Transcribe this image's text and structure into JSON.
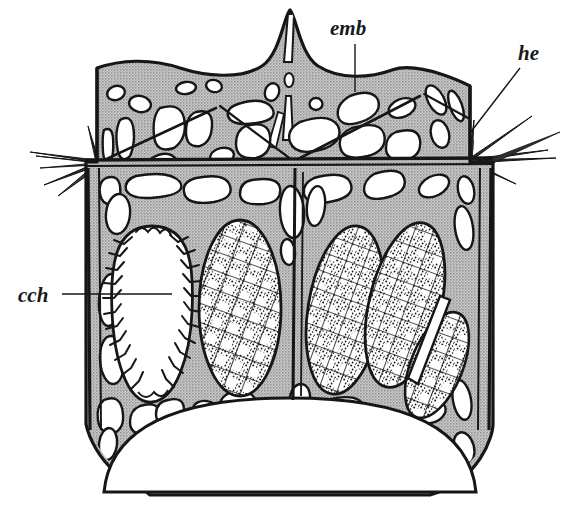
{
  "figure": {
    "background_color": "#ffffff",
    "ink_color": "#161616",
    "matrix_color": "#b6b6b6",
    "lacuna_color": "#ffffff",
    "embryo_fill": "#ffffff",
    "embryo_stipple_color": "#1a1a1a"
  },
  "labels": [
    {
      "id": "emb",
      "text": "emb",
      "meaning": "embryo",
      "x": 330,
      "y": 35,
      "font_size": 21,
      "leader": {
        "type": "vertical",
        "x1": 355,
        "y1": 44,
        "x2": 355,
        "y2": 92
      }
    },
    {
      "id": "he",
      "text": "he",
      "meaning": "hyperstome / edge spine",
      "x": 518,
      "y": 60,
      "font_size": 21,
      "leader": {
        "type": "diagonal",
        "x1": 520,
        "y1": 68,
        "x2": 470,
        "y2": 133
      }
    },
    {
      "id": "cch",
      "text": "cch",
      "meaning": "cystid chamber",
      "x": 18,
      "y": 300,
      "font_size": 21,
      "leader": {
        "type": "horizontal",
        "x1": 62,
        "y1": 294,
        "x2": 172,
        "y2": 294
      }
    }
  ],
  "structures": {
    "upper_chamber": {
      "name": "upper zooecial chamber",
      "lacuna_count": 26
    },
    "lower_chamber": {
      "name": "lower brood chamber",
      "lacuna_count": 30
    },
    "central_spire": {
      "name": "central twin-pointed spire",
      "x": 290,
      "y": 10
    },
    "basal_arch": {
      "name": "basal arched opening",
      "y": 430
    },
    "spine_nodes": [
      {
        "name": "left-spine-cluster",
        "x": 96,
        "y": 162,
        "rays": 5
      },
      {
        "name": "right-spine-cluster",
        "x": 470,
        "y": 158,
        "rays": 4
      },
      {
        "name": "center-spine-node",
        "x": 295,
        "y": 160,
        "rays": 3
      }
    ]
  },
  "embryos": [
    {
      "id": "cch-oval",
      "kind": "crenulated-empty",
      "cx": 152,
      "cy": 315,
      "rx": 40,
      "ry": 88,
      "rot": -3
    },
    {
      "id": "embryo-1",
      "kind": "stippled-mesh",
      "cx": 240,
      "cy": 308,
      "rx": 41,
      "ry": 88,
      "rot": 0
    },
    {
      "id": "embryo-2",
      "kind": "stippled-mesh",
      "cx": 345,
      "cy": 310,
      "rx": 37,
      "ry": 85,
      "rot": 9
    },
    {
      "id": "embryo-3",
      "kind": "stippled-mesh",
      "cx": 405,
      "cy": 305,
      "rx": 36,
      "ry": 84,
      "rot": 13
    },
    {
      "id": "embryo-4",
      "kind": "stippled-mesh",
      "cx": 437,
      "cy": 365,
      "rx": 26,
      "ry": 56,
      "rot": 22
    }
  ]
}
